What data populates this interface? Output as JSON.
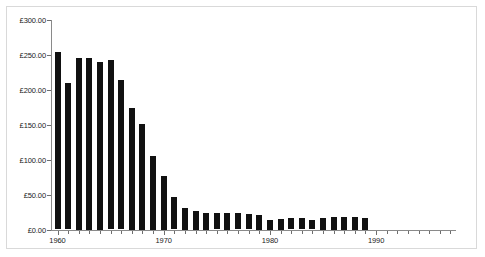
{
  "chart_data": {
    "type": "bar",
    "title": "",
    "subtitle": "",
    "xlabel": "",
    "ylabel": "",
    "currency_symbol": "£",
    "ylim": [
      0,
      300
    ],
    "xlim": [
      1959.3,
      1998.5
    ],
    "grid": false,
    "legend": null,
    "y_ticks": [
      0,
      50,
      100,
      150,
      200,
      250,
      300
    ],
    "y_tick_labels": [
      "£0.00",
      "£50.00",
      "£100.00",
      "£150.00",
      "£200.00",
      "£250.00",
      "£300.00"
    ],
    "x_tick_labels": [
      "1960",
      "1970",
      "1980",
      "1990"
    ],
    "x_tick_values": [
      1960,
      1970,
      1980,
      1990
    ],
    "x_minor_tick_step": 1,
    "bar_color": "#111111",
    "axis_color": "#8a8a8a",
    "frame_color": "#d9d9d9",
    "categories": [
      1960,
      1961,
      1962,
      1963,
      1964,
      1965,
      1966,
      1967,
      1968,
      1969,
      1970,
      1971,
      1972,
      1973,
      1974,
      1975,
      1976,
      1977,
      1978,
      1979,
      1980,
      1981,
      1982,
      1983,
      1984,
      1985,
      1986,
      1987,
      1988,
      1989
    ],
    "values": [
      253,
      209,
      245,
      245,
      240,
      242,
      213,
      174,
      151,
      105,
      77,
      46,
      31,
      27,
      24,
      23,
      24,
      23,
      22,
      21,
      14,
      15,
      16,
      16,
      13,
      17,
      18,
      18,
      18,
      17
    ]
  },
  "frame": {
    "background": "#ffffff"
  }
}
